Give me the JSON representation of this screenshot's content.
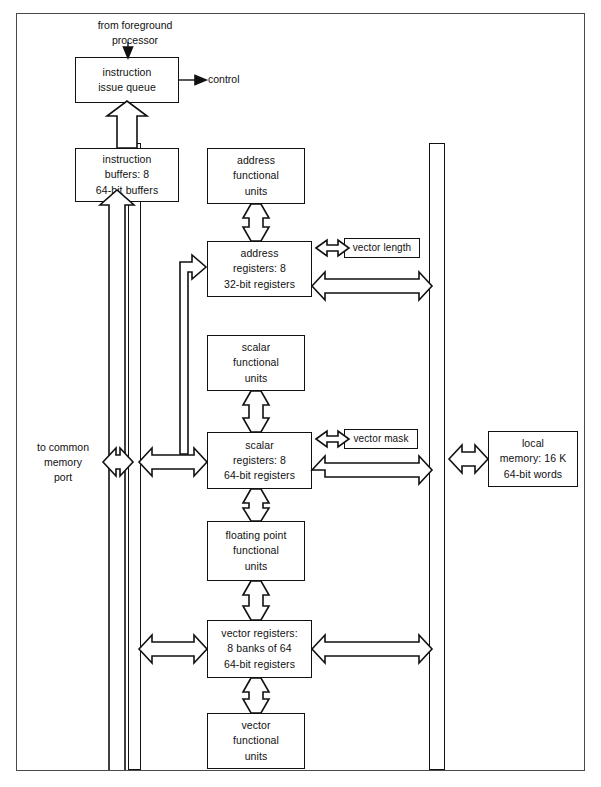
{
  "diagram": {
    "frame": {
      "stroke": "#4a4a4a"
    },
    "ink": "#111111",
    "paper": "#ffffff"
  },
  "labels": {
    "from_foreground": "from  foreground\nprocessor",
    "control": "control",
    "to_common_memory": "to  common\nmemory\nport"
  },
  "boxes": {
    "instruction_issue_queue": "instruction\nissue  queue",
    "instruction_buffers": "instruction\nbuffers:  8\n64-bit  buffers",
    "address_functional_units": "address\nfunctional\nunits",
    "address_registers": "address\nregisters:  8\n32-bit  registers",
    "vector_length": "vector length",
    "scalar_functional_units": "scalar\nfunctional\nunits",
    "scalar_registers": "scalar\nregisters:  8\n64-bit  registers",
    "vector_mask": "vector mask",
    "local_memory": "local\nmemory:  16 K\n64-bit  words",
    "floating_point_functional_units": "floating  point\nfunctional\nunits",
    "vector_registers": "vector  registers:\n8  banks  of  64\n64-bit  registers",
    "vector_functional_units": "vector\nfunctional\nunits"
  },
  "buses": {
    "left_inner": "instruction-fetch-bus",
    "left_outer": "memory-data-bus",
    "right": "local-memory-bus"
  },
  "connections": [
    {
      "from": "from-foreground-processor",
      "to": "instruction-issue-queue",
      "style": "thin-arrow-down"
    },
    {
      "from": "instruction-issue-queue",
      "to": "control",
      "style": "thin-arrow-right"
    },
    {
      "from": "instruction-buffers",
      "to": "instruction-issue-queue",
      "style": "block-arrow-up"
    },
    {
      "from": "left-inner-bus",
      "to": "instruction-buffers",
      "style": "block-arrow-up"
    },
    {
      "from": "address-functional-units",
      "to": "address-registers",
      "style": "block-arrow-bidirectional-vertical"
    },
    {
      "from": "address-registers",
      "to": "vector-length",
      "style": "block-arrow-bidirectional-horizontal"
    },
    {
      "from": "address-registers",
      "to": "right-bus",
      "style": "block-arrow-bidirectional-horizontal"
    },
    {
      "from": "left-outer-bus",
      "to": "address-registers",
      "style": "block-arrow-right"
    },
    {
      "from": "scalar-functional-units",
      "to": "scalar-registers",
      "style": "block-arrow-bidirectional-vertical"
    },
    {
      "from": "scalar-registers",
      "to": "vector-mask",
      "style": "block-arrow-bidirectional-horizontal"
    },
    {
      "from": "scalar-registers",
      "to": "right-bus",
      "style": "block-arrow-bidirectional-horizontal"
    },
    {
      "from": "left-outer-bus",
      "to": "scalar-registers",
      "style": "block-arrow-bidirectional-horizontal"
    },
    {
      "from": "to-common-memory-port",
      "to": "left-outer-bus",
      "style": "block-arrow-bidirectional-horizontal"
    },
    {
      "from": "scalar-registers",
      "to": "floating-point-functional-units",
      "style": "block-arrow-bidirectional-vertical"
    },
    {
      "from": "floating-point-functional-units",
      "to": "vector-registers",
      "style": "block-arrow-bidirectional-vertical"
    },
    {
      "from": "left-outer-bus",
      "to": "vector-registers",
      "style": "block-arrow-bidirectional-horizontal"
    },
    {
      "from": "vector-registers",
      "to": "right-bus",
      "style": "block-arrow-bidirectional-horizontal"
    },
    {
      "from": "vector-registers",
      "to": "vector-functional-units",
      "style": "block-arrow-bidirectional-vertical"
    },
    {
      "from": "right-bus",
      "to": "local-memory",
      "style": "block-arrow-bidirectional-horizontal"
    }
  ]
}
